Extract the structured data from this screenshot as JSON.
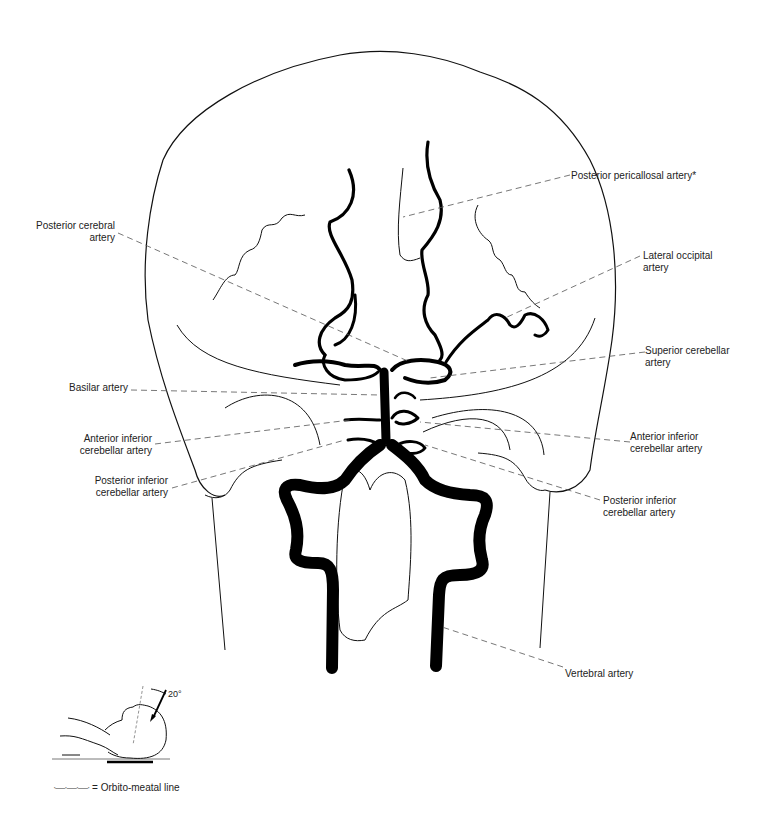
{
  "figure": {
    "view": "Frontal (Towne) projection of vertebrobasilar angiogram",
    "labels": {
      "posterior_pericallosal": "Posterior pericallosal artery*",
      "posterior_cerebral_l1": "Posterior cerebral",
      "posterior_cerebral_l2": "artery",
      "lateral_occipital_l1": "Lateral occipital",
      "lateral_occipital_l2": "artery",
      "superior_cerebellar_l1": "Superior cerebellar",
      "superior_cerebellar_l2": "artery",
      "basilar": "Basilar artery",
      "aica_left_l1": "Anterior inferior",
      "aica_left_l2": "cerebellar artery",
      "aica_right_l1": "Anterior inferior",
      "aica_right_l2": "cerebellar artery",
      "pica_left_l1": "Posterior inferior",
      "pica_left_l2": "cerebellar artery",
      "pica_right_l1": "Posterior inferior",
      "pica_right_l2": "cerebellar artery",
      "vertebral": "Vertebral artery"
    },
    "inset": {
      "angle": "20°",
      "legend_symbol": "·—·—·—·",
      "legend_text": "= Orbito-meatal line"
    }
  }
}
